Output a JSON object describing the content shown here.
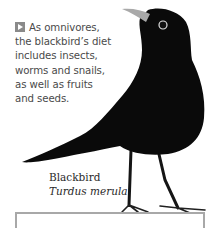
{
  "caption": {
    "icon": "play-square-icon",
    "lines": [
      "As omnivores,",
      "the blackbird’s diet",
      "includes insects,",
      "worms and snails,",
      "as well as fruits",
      "and seeds."
    ]
  },
  "label": {
    "common_name": "Blackbird",
    "scientific_name": "Turdus merula"
  },
  "colors": {
    "text": "#4a4a4a",
    "icon": "#8a8a8a",
    "bird": "#0a0a0a",
    "box_border": "#a8a8a8"
  }
}
